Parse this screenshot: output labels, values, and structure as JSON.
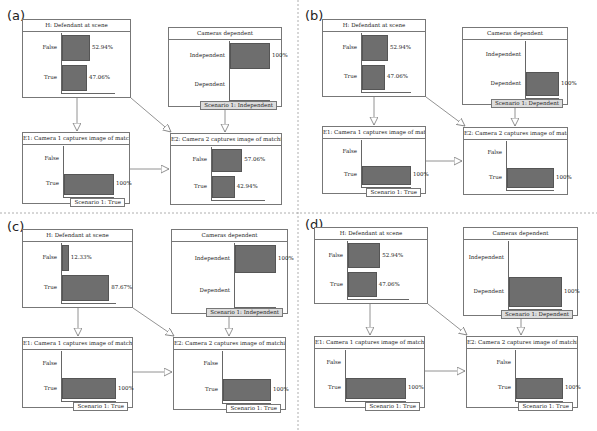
{
  "panels": [
    {
      "id": "a",
      "label": "(a)",
      "nodes": {
        "H": {
          "title": "H: Defendant at scene",
          "states": [
            {
              "label": "False",
              "value": 52.94,
              "text": "52.94%"
            },
            {
              "label": "True",
              "value": 47.06,
              "text": "47.06%"
            }
          ]
        },
        "C": {
          "title": "Cameras dependent",
          "states": [
            {
              "label": "Independent",
              "value": 100,
              "text": "100%"
            },
            {
              "label": "Dependent",
              "value": 0,
              "text": ""
            }
          ],
          "scenario": "Scenario 1: Independent"
        },
        "E1": {
          "title": "E1:  Camera 1 captures image of matching",
          "states": [
            {
              "label": "False",
              "value": 0,
              "text": ""
            },
            {
              "label": "True",
              "value": 100,
              "text": "100%"
            }
          ],
          "scenario": "Scenario 1: True"
        },
        "E2": {
          "title": "E2:  Camera 2 captures image of matching",
          "states": [
            {
              "label": "False",
              "value": 57.06,
              "text": "57.06%"
            },
            {
              "label": "True",
              "value": 42.94,
              "text": "42.94%"
            }
          ],
          "scenario": ""
        }
      }
    },
    {
      "id": "b",
      "label": "(b)",
      "nodes": {
        "H": {
          "title": "H: Defendant at scene",
          "states": [
            {
              "label": "False",
              "value": 52.94,
              "text": "52.94%"
            },
            {
              "label": "True",
              "value": 47.06,
              "text": "47.06%"
            }
          ]
        },
        "C": {
          "title": "Cameras dependent",
          "states": [
            {
              "label": "Independent",
              "value": 0,
              "text": ""
            },
            {
              "label": "Dependent",
              "value": 100,
              "text": "100%"
            }
          ],
          "scenario": "Scenario 1: Dependent"
        },
        "E1": {
          "title": "E1:  Camera 1 captures image of matching",
          "states": [
            {
              "label": "False",
              "value": 0,
              "text": ""
            },
            {
              "label": "True",
              "value": 100,
              "text": "100%"
            }
          ],
          "scenario": "Scenario 1: True"
        },
        "E2": {
          "title": "E2:  Camera 2 captures image of matching",
          "states": [
            {
              "label": "False",
              "value": 0,
              "text": ""
            },
            {
              "label": "True",
              "value": 100,
              "text": "100%"
            }
          ],
          "scenario": ""
        }
      }
    },
    {
      "id": "c",
      "label": "(c)",
      "nodes": {
        "H": {
          "title": "H: Defendant at scene",
          "states": [
            {
              "label": "False",
              "value": 12.33,
              "text": "12.33%"
            },
            {
              "label": "True",
              "value": 87.67,
              "text": "87.67%"
            }
          ]
        },
        "C": {
          "title": "Cameras dependent",
          "states": [
            {
              "label": "Independent",
              "value": 100,
              "text": "100%"
            },
            {
              "label": "Dependent",
              "value": 0,
              "text": ""
            }
          ],
          "scenario": "Scenario 1: Independent"
        },
        "E1": {
          "title": "E1:  Camera 1 captures image of matching",
          "states": [
            {
              "label": "False",
              "value": 0,
              "text": ""
            },
            {
              "label": "True",
              "value": 100,
              "text": "100%"
            }
          ],
          "scenario": "Scenario 1: True"
        },
        "E2": {
          "title": "E2:  Camera 2 captures image of matching",
          "states": [
            {
              "label": "False",
              "value": 0,
              "text": ""
            },
            {
              "label": "True",
              "value": 100,
              "text": "100%"
            }
          ],
          "scenario": "Scenario 1: True"
        }
      }
    },
    {
      "id": "d",
      "label": "(d)",
      "nodes": {
        "H": {
          "title": "H: Defendant at scene",
          "states": [
            {
              "label": "False",
              "value": 52.94,
              "text": "52.94%"
            },
            {
              "label": "True",
              "value": 47.06,
              "text": "47.06%"
            }
          ]
        },
        "C": {
          "title": "Cameras dependent",
          "states": [
            {
              "label": "Independent",
              "value": 0,
              "text": ""
            },
            {
              "label": "Dependent",
              "value": 100,
              "text": "100%"
            }
          ],
          "scenario": "Scenario 1: Dependent"
        },
        "E1": {
          "title": "E1:  Camera 1 captures image of matching",
          "states": [
            {
              "label": "False",
              "value": 0,
              "text": ""
            },
            {
              "label": "True",
              "value": 100,
              "text": "100%"
            }
          ],
          "scenario": "Scenario 1: True"
        },
        "E2": {
          "title": "E2:  Camera 2 captures image of matching",
          "states": [
            {
              "label": "False",
              "value": 0,
              "text": ""
            },
            {
              "label": "True",
              "value": 100,
              "text": "100%"
            }
          ],
          "scenario": "Scenario 1: True"
        }
      }
    }
  ],
  "colors": {
    "bar": "#6e6e6e",
    "border": "#777777",
    "scenario_shaded": "#dddddd"
  }
}
